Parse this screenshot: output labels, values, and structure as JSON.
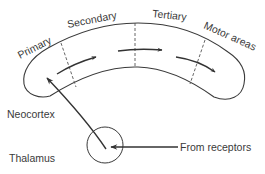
{
  "diagram": {
    "type": "flow",
    "labels": {
      "primary": "Primary",
      "secondary": "Secondary",
      "tertiary": "Tertiary",
      "motor": "Motor areas",
      "neocortex": "Neocortex",
      "thalamus": "Thalamus",
      "receptors": "From receptors"
    },
    "nodes": [
      {
        "id": "receptors",
        "label": "From receptors"
      },
      {
        "id": "thalamus",
        "label": "Thalamus"
      },
      {
        "id": "primary",
        "label": "Primary"
      },
      {
        "id": "secondary",
        "label": "Secondary"
      },
      {
        "id": "tertiary",
        "label": "Tertiary"
      },
      {
        "id": "motor",
        "label": "Motor areas"
      }
    ],
    "edges": [
      {
        "from": "receptors",
        "to": "thalamus"
      },
      {
        "from": "thalamus",
        "to": "primary"
      },
      {
        "from": "primary",
        "to": "secondary"
      },
      {
        "from": "secondary",
        "to": "tertiary"
      },
      {
        "from": "tertiary",
        "to": "motor"
      }
    ],
    "colors": {
      "line": "#3a3a3a",
      "background": "#ffffff"
    }
  }
}
